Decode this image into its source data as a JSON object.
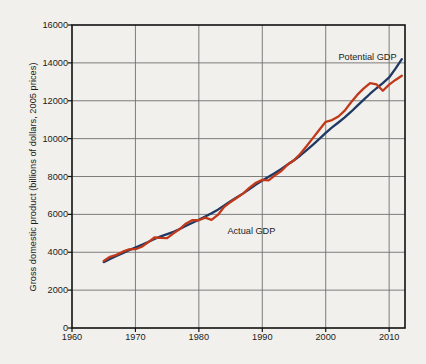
{
  "chart_data": {
    "type": "line",
    "title": "",
    "xlabel": "",
    "ylabel": "Gross domestic product (billions of dollars, 2005 prices)",
    "xlim": [
      1960,
      2012.5
    ],
    "ylim": [
      0,
      16000
    ],
    "grid": true,
    "legend_position": "inline-annotations",
    "xticks": [
      1960,
      1970,
      1980,
      1990,
      2000,
      2010
    ],
    "xtick_labels": [
      "1960",
      "1970",
      "1980",
      "1990",
      "2000",
      "2010"
    ],
    "yticks": [
      0,
      2000,
      4000,
      6000,
      8000,
      10000,
      12000,
      14000,
      16000
    ],
    "ytick_labels": [
      "0",
      "2000",
      "4000",
      "6000",
      "8000",
      "10000",
      "12000",
      "14000",
      "16000"
    ],
    "annotations": [
      {
        "text": "Potential GDP",
        "x": 2002.0,
        "y": 14250
      },
      {
        "text": "Actual GDP",
        "x": 1984.5,
        "y": 5050
      }
    ],
    "colors": {
      "potential_gdp": "#1f3864",
      "actual_gdp": "#c0391b",
      "grid": "#6f6f6f",
      "axis": "#111111",
      "background": "#f1f0ec"
    },
    "x": [
      1965,
      1966,
      1967,
      1968,
      1969,
      1970,
      1971,
      1972,
      1973,
      1974,
      1975,
      1976,
      1977,
      1978,
      1979,
      1980,
      1981,
      1982,
      1983,
      1984,
      1985,
      1986,
      1987,
      1988,
      1989,
      1990,
      1991,
      1992,
      1993,
      1994,
      1995,
      1996,
      1997,
      1998,
      1999,
      2000,
      2001,
      2002,
      2003,
      2004,
      2005,
      2006,
      2007,
      2008,
      2009,
      2010,
      2011,
      2012
    ],
    "series": [
      {
        "name": "Potential GDP",
        "color": "#1f3864",
        "values": [
          3480,
          3650,
          3800,
          3950,
          4110,
          4250,
          4390,
          4540,
          4700,
          4840,
          4960,
          5080,
          5230,
          5400,
          5560,
          5720,
          5890,
          6060,
          6250,
          6470,
          6690,
          6900,
          7110,
          7340,
          7570,
          7790,
          7990,
          8190,
          8400,
          8630,
          8860,
          9110,
          9390,
          9680,
          9990,
          10300,
          10590,
          10850,
          11120,
          11420,
          11740,
          12060,
          12370,
          12660,
          12930,
          13230,
          13700,
          14200
        ]
      },
      {
        "name": "Actual GDP",
        "color": "#c0391b",
        "values": [
          3540,
          3760,
          3860,
          4030,
          4150,
          4160,
          4290,
          4520,
          4780,
          4760,
          4750,
          5000,
          5230,
          5520,
          5700,
          5690,
          5830,
          5710,
          5970,
          6400,
          6650,
          6880,
          7110,
          7410,
          7670,
          7820,
          7800,
          8060,
          8290,
          8630,
          8860,
          9200,
          9610,
          10040,
          10470,
          10890,
          10980,
          11170,
          11480,
          11920,
          12320,
          12650,
          12930,
          12870,
          12530,
          12850,
          13100,
          13320
        ]
      }
    ]
  },
  "axis_geometry": {
    "plot_left": 72,
    "plot_right": 405,
    "plot_top": 25,
    "plot_bottom": 328
  }
}
